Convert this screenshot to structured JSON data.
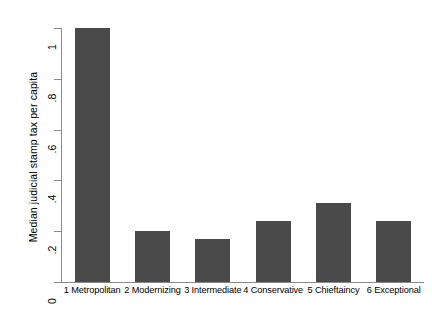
{
  "chart_data": {
    "type": "bar",
    "title": "",
    "subtitle": "",
    "xlabel": "",
    "ylabel": "Median judicial stamp tax per capita",
    "categories": [
      "1 Metropolitan",
      "2 Modernizing",
      "3 Intermediate",
      "4 Conservative",
      "5 Chieftaincy",
      "6 Exceptional"
    ],
    "values": [
      1.0,
      0.2,
      0.17,
      0.24,
      0.31,
      0.24
    ],
    "ylim": [
      0,
      1
    ],
    "yticks": [
      0,
      0.2,
      0.4,
      0.6,
      0.8,
      1
    ],
    "ytick_labels": [
      "0",
      ".2",
      ".4",
      ".6",
      ".8",
      "1"
    ],
    "grid": false,
    "legend": false,
    "legend_position": "none",
    "bar_color": "#4a4a4a",
    "background_color": "#ffffff",
    "axis_color": "#8a8a8a"
  }
}
